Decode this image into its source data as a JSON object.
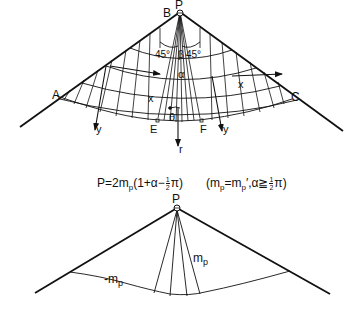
{
  "top_figure": {
    "labels": {
      "apex": "P",
      "B": "B",
      "A": "A",
      "C": "C",
      "E": "E",
      "F": "F",
      "angle_left": "45°",
      "angle_right": "45°",
      "beta": "β",
      "alpha": "α",
      "theta": "θ",
      "x_left": "x",
      "x_right": "x",
      "y_left": "y",
      "y_right": "y",
      "r": "r"
    }
  },
  "formula": {
    "main_prefix": "P=2m",
    "main_sub": "p",
    "main_mid": "(1+α−",
    "frac_num": "1",
    "frac_den": "2",
    "main_suffix": "π)",
    "cond_open": "(m",
    "cond_sub1": "p",
    "cond_eq": "=m",
    "cond_sub2": "p",
    "cond_prime": "′",
    "cond_mid": ",α≧",
    "cond_frac_num": "1",
    "cond_frac_den": "2",
    "cond_close": "π)"
  },
  "bottom_figure": {
    "labels": {
      "apex": "P",
      "positive_moment": "m",
      "positive_moment_sub": "p",
      "negative_moment": "-m",
      "negative_moment_sub": "p"
    }
  },
  "colors": {
    "ink": "#111111",
    "background": "#ffffff"
  }
}
